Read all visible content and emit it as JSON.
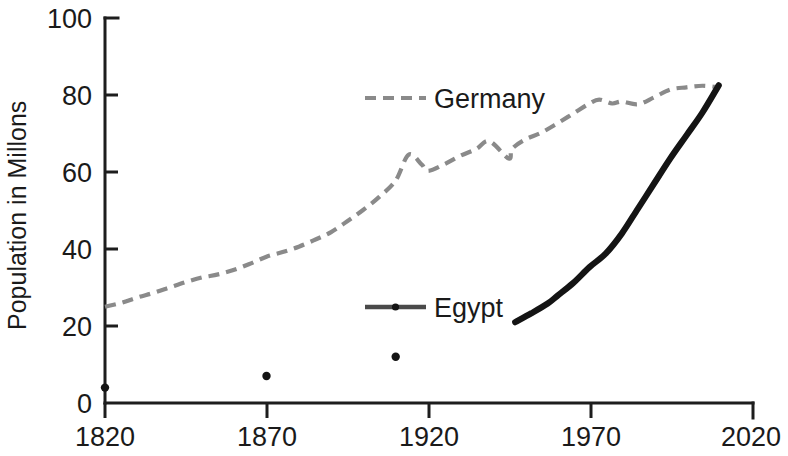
{
  "chart_data": {
    "type": "line",
    "title": "",
    "xlabel": "",
    "ylabel": "Population in Millons",
    "xlim": [
      1820,
      2020
    ],
    "ylim": [
      0,
      100
    ],
    "grid": false,
    "legend_position": "inside-plot",
    "xticks": [
      "1820",
      "1870",
      "1920",
      "1970",
      "2020"
    ],
    "xtick_values": [
      1820,
      1870,
      1920,
      1970,
      2020
    ],
    "yticks": [
      "0",
      "20",
      "40",
      "60",
      "80",
      "100"
    ],
    "ytick_values": [
      0,
      20,
      40,
      60,
      80,
      100
    ],
    "series": [
      {
        "name": "Germany",
        "style": "dashed",
        "color": "#8a8a8a",
        "x": [
          1820,
          1825,
          1830,
          1835,
          1840,
          1845,
          1850,
          1855,
          1860,
          1865,
          1870,
          1875,
          1880,
          1885,
          1890,
          1895,
          1900,
          1905,
          1910,
          1914,
          1918,
          1920,
          1925,
          1930,
          1935,
          1939,
          1945,
          1946,
          1950,
          1955,
          1960,
          1965,
          1970,
          1973,
          1977,
          1980,
          1985,
          1990,
          1995,
          2000,
          2005,
          2010
        ],
        "values": [
          25.0,
          26.0,
          27.4,
          28.6,
          30.0,
          31.4,
          32.6,
          33.4,
          34.6,
          36.2,
          38.0,
          39.2,
          40.6,
          42.4,
          44.4,
          47.2,
          50.2,
          53.6,
          57.8,
          64.5,
          62.0,
          60.3,
          62.0,
          64.2,
          66.0,
          68.0,
          63.5,
          66.0,
          68.4,
          70.2,
          72.6,
          75.2,
          77.8,
          78.8,
          77.8,
          78.3,
          77.6,
          79.4,
          81.4,
          82.0,
          82.4,
          82.0
        ]
      },
      {
        "name": "Egypt",
        "style": "solid",
        "color": "#141414",
        "x": [
          1947,
          1952,
          1957,
          1960,
          1965,
          1970,
          1975,
          1980,
          1985,
          1990,
          1995,
          2000,
          2005,
          2010
        ],
        "values": [
          21.0,
          23.3,
          25.8,
          27.8,
          31.2,
          35.3,
          38.8,
          44.0,
          50.5,
          57.0,
          63.5,
          69.5,
          75.5,
          82.5
        ]
      }
    ],
    "scatter_points": [
      {
        "x": 1820,
        "y": 4.0
      },
      {
        "x": 1870,
        "y": 7.0
      },
      {
        "x": 1910,
        "y": 12.0
      }
    ],
    "legend": [
      {
        "label": "Germany",
        "style": "dashed",
        "color": "#8a8a8a"
      },
      {
        "label": "Egypt",
        "style": "solid-with-marker",
        "color": "#4a4a4a"
      }
    ]
  },
  "axes": {
    "y_title": "Population in Millons"
  }
}
